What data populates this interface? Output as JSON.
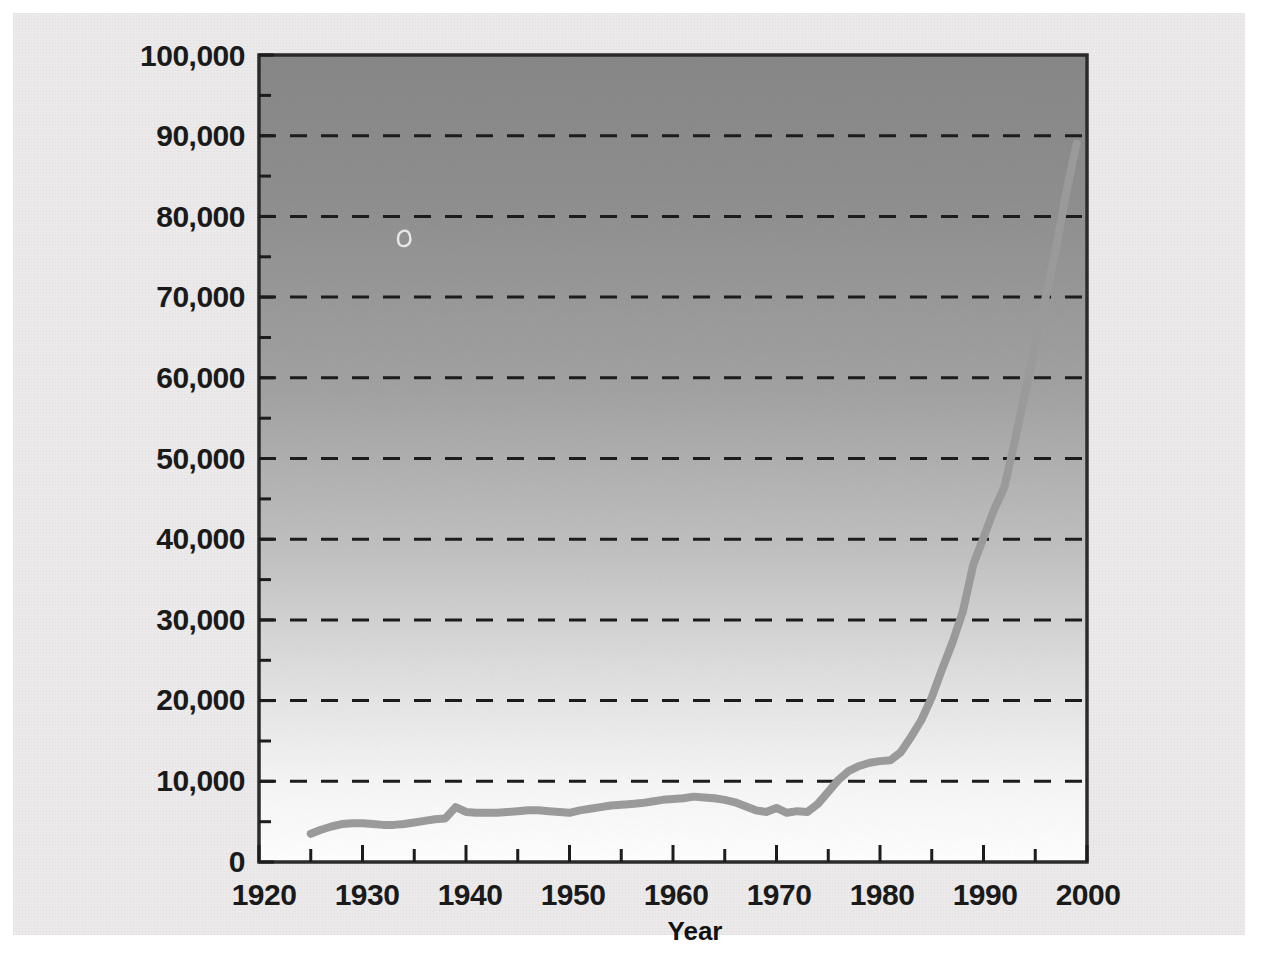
{
  "chart_data": {
    "type": "line",
    "title": "",
    "subtitle": "",
    "xlabel": "Year",
    "ylabel": "",
    "xlim": [
      1920,
      2000
    ],
    "ylim": [
      0,
      100000
    ],
    "grid": "horizontal dashed at every 10,000",
    "legend": "none",
    "x_tick_labels": [
      "1920",
      "1930",
      "1940",
      "1950",
      "1960",
      "1970",
      "1980",
      "1990",
      "2000"
    ],
    "x_ticks": [
      1920,
      1930,
      1940,
      1950,
      1960,
      1970,
      1980,
      1990,
      2000
    ],
    "x_minor_ticks": [
      1925,
      1935,
      1945,
      1955,
      1965,
      1975,
      1985,
      1995
    ],
    "y_tick_labels": [
      "0",
      "10,000",
      "20,000",
      "30,000",
      "40,000",
      "50,000",
      "60,000",
      "70,000",
      "80,000",
      "90,000",
      "100,000"
    ],
    "y_ticks": [
      0,
      10000,
      20000,
      30000,
      40000,
      50000,
      60000,
      70000,
      80000,
      90000,
      100000
    ],
    "y_minor_ticks": [
      5000,
      15000,
      25000,
      35000,
      45000,
      55000,
      65000,
      75000,
      85000,
      95000
    ],
    "series": [
      {
        "name": "value",
        "color": "#9a9a9a",
        "x": [
          1925,
          1926,
          1927,
          1928,
          1929,
          1930,
          1931,
          1932,
          1933,
          1934,
          1935,
          1936,
          1937,
          1938,
          1939,
          1940,
          1941,
          1942,
          1943,
          1944,
          1945,
          1946,
          1947,
          1948,
          1949,
          1950,
          1951,
          1952,
          1953,
          1954,
          1955,
          1956,
          1957,
          1958,
          1959,
          1960,
          1961,
          1962,
          1963,
          1964,
          1965,
          1966,
          1967,
          1968,
          1969,
          1970,
          1971,
          1972,
          1973,
          1974,
          1975,
          1976,
          1977,
          1978,
          1979,
          1980,
          1981,
          1982,
          1983,
          1984,
          1985,
          1986,
          1987,
          1988,
          1989,
          1990,
          1991,
          1992,
          1993,
          1994,
          1995,
          1996,
          1997,
          1998,
          1999
        ],
        "values": [
          3500,
          4000,
          4400,
          4700,
          4800,
          4800,
          4700,
          4600,
          4600,
          4700,
          4900,
          5100,
          5300,
          5400,
          6800,
          6200,
          6100,
          6100,
          6100,
          6200,
          6300,
          6400,
          6400,
          6300,
          6200,
          6100,
          6400,
          6600,
          6800,
          7000,
          7100,
          7200,
          7300,
          7500,
          7700,
          7800,
          7900,
          8100,
          8000,
          7900,
          7700,
          7400,
          6900,
          6400,
          6200,
          6700,
          6100,
          6300,
          6200,
          7200,
          8700,
          10200,
          11300,
          11900,
          12300,
          12500,
          12600,
          13600,
          15500,
          17600,
          20400,
          23900,
          27200,
          31000,
          36800,
          40200,
          43600,
          46400,
          52000,
          58000,
          64000,
          70000,
          76000,
          83000,
          89000
        ]
      }
    ]
  },
  "figure": {
    "background_color": "#eceaea",
    "plot_gradient_top": "#8e8e8e",
    "plot_gradient_bottom": "#ffffff",
    "frame_color": "#2b2b2b",
    "gridline_color": "#1a1a1a",
    "line_color": "#9a9a9a"
  }
}
